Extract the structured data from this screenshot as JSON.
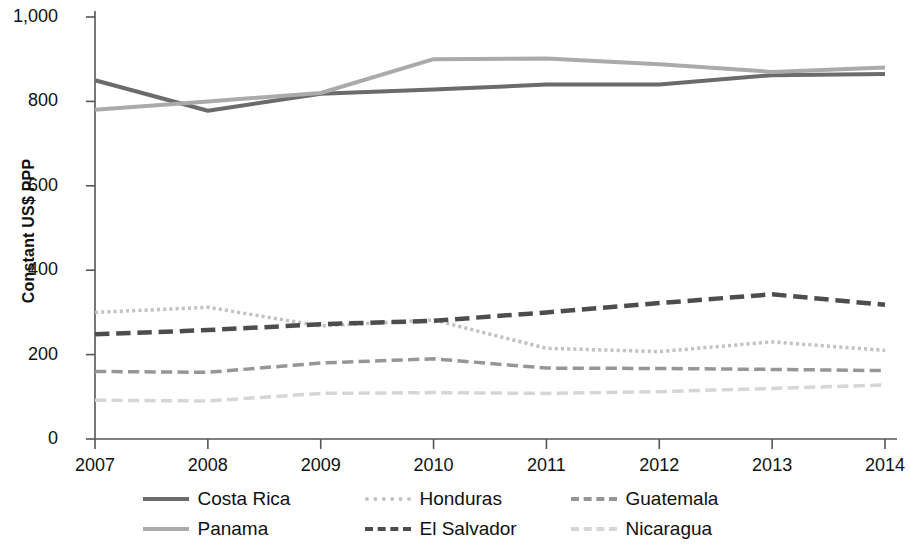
{
  "chart_data": {
    "type": "line",
    "title": "",
    "xlabel": "",
    "ylabel": "Constant US$ PPP",
    "x": [
      2007,
      2008,
      2009,
      2010,
      2011,
      2012,
      2013,
      2014
    ],
    "categories": [
      "2007",
      "2008",
      "2009",
      "2010",
      "2011",
      "2012",
      "2013",
      "2014"
    ],
    "xlim": [
      2007,
      2014
    ],
    "ylim": [
      0,
      1000
    ],
    "yticks": [
      0,
      200,
      400,
      600,
      800,
      1000
    ],
    "ytick_labels": [
      "0",
      "200",
      "400",
      "600",
      "800",
      "1,000"
    ],
    "grid": false,
    "legend_position": "bottom",
    "series": [
      {
        "name": "Costa Rica",
        "color": "#6b6b6b",
        "style": "solid",
        "width": 4.0,
        "values": [
          850,
          778,
          818,
          828,
          840,
          840,
          862,
          865
        ]
      },
      {
        "name": "Panama",
        "color": "#aaaaaa",
        "style": "solid",
        "width": 4.0,
        "values": [
          780,
          800,
          820,
          900,
          902,
          888,
          870,
          880
        ]
      },
      {
        "name": "Honduras",
        "color": "#c2c2c2",
        "style": "dotted",
        "width": 3.5,
        "values": [
          300,
          312,
          268,
          282,
          215,
          207,
          230,
          210
        ]
      },
      {
        "name": "El Salvador",
        "color": "#4d4d4d",
        "style": "dashed",
        "width": 4.5,
        "values": [
          248,
          258,
          272,
          280,
          300,
          322,
          343,
          318
        ]
      },
      {
        "name": "Guatemala",
        "color": "#969696",
        "style": "dashed",
        "width": 3.5,
        "values": [
          160,
          158,
          180,
          190,
          168,
          167,
          165,
          162
        ]
      },
      {
        "name": "Nicaragua",
        "color": "#d6d6d6",
        "style": "dashed",
        "width": 3.5,
        "values": [
          92,
          90,
          108,
          110,
          108,
          112,
          120,
          128
        ]
      }
    ]
  },
  "legend": {
    "rows": [
      [
        "Costa Rica",
        "Honduras",
        "Guatemala"
      ],
      [
        "Panama",
        "El Salvador",
        "Nicaragua"
      ]
    ]
  }
}
